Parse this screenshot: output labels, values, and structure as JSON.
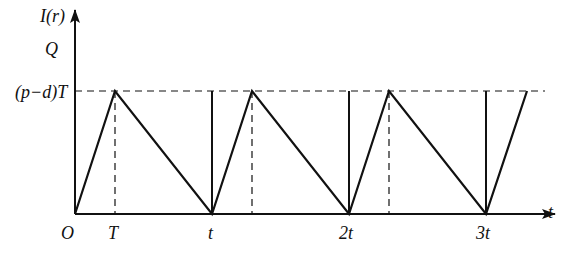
{
  "diagram": {
    "type": "inventory sawtooth graph",
    "y_axis": {
      "label": "I(r)",
      "level_label_Q": "Q",
      "level_label_peak": "(p−d)T"
    },
    "x_axis": {
      "label": "t",
      "origin_label": "O",
      "ticks": [
        {
          "label": "T",
          "x": 115
        },
        {
          "label": "t",
          "x": 212
        },
        {
          "label": "2t",
          "x": 349
        },
        {
          "label": "3t",
          "x": 486
        }
      ]
    },
    "geometry": {
      "origin": [
        75,
        214
      ],
      "peak_y": 91,
      "cycles": [
        {
          "start": 75,
          "peak": 115,
          "end": 212
        },
        {
          "start": 212,
          "peak": 252,
          "end": 349
        },
        {
          "start": 349,
          "peak": 389,
          "end": 486
        },
        {
          "start": 486,
          "peak": 527,
          "end": null
        }
      ],
      "vertical_lines_x": [
        212,
        349,
        486
      ],
      "dashed_drops_x": [
        115,
        252,
        389
      ]
    },
    "colors": {
      "line": "#111111",
      "background": "#ffffff"
    }
  }
}
